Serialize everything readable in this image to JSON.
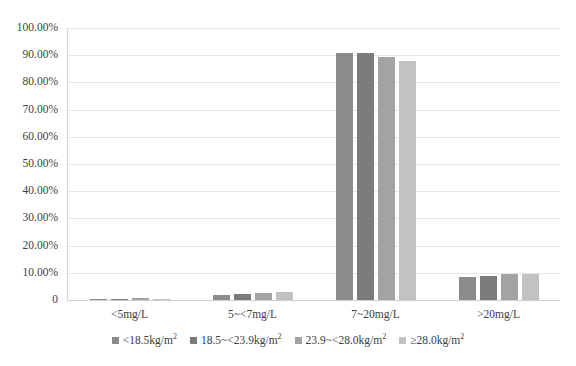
{
  "chart_data": {
    "type": "bar",
    "title": "",
    "xlabel": "",
    "ylabel": "",
    "grid": true,
    "legend_position": "bottom",
    "ylim": [
      0,
      100
    ],
    "ytick_labels": [
      "100.00%",
      "90.00%",
      "80.00%",
      "70.00%",
      "60.00%",
      "50.00%",
      "40.00%",
      "30.00%",
      "20.00%",
      "10.00%",
      "0"
    ],
    "ytick_values": [
      100,
      90,
      80,
      70,
      60,
      50,
      40,
      30,
      20,
      10,
      0
    ],
    "categories": [
      "<5mg/L",
      "5~<7mg/L",
      "7~20mg/L",
      ">20mg/L"
    ],
    "series": [
      {
        "name": "<18.5kg/m2",
        "name_base": "<18.5kg/m",
        "name_sup": "2",
        "color": "#8c8c8c",
        "values": [
          0.4,
          2.0,
          90.8,
          8.6
        ]
      },
      {
        "name": "18.5~<23.9kg/m2",
        "name_base": "18.5~<23.9kg/m",
        "name_sup": "2",
        "color": "#7b7b7b",
        "values": [
          0.5,
          2.2,
          90.7,
          8.8
        ]
      },
      {
        "name": "23.9~<28.0kg/m2",
        "name_base": "23.9~<28.0kg/m",
        "name_sup": "2",
        "color": "#a3a3a3",
        "values": [
          0.6,
          2.4,
          89.2,
          9.4
        ]
      },
      {
        "name": "≥28.0kg/m2",
        "name_base": "≥28.0kg/m",
        "name_sup": "2",
        "color": "#c2c2c2",
        "values": [
          0.3,
          3.0,
          87.8,
          9.6
        ]
      }
    ]
  }
}
